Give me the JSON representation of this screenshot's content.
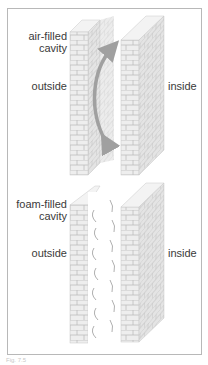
{
  "panels": [
    {
      "id": "air",
      "cavity_label_line1": "air-filled",
      "cavity_label_line2": "cavity",
      "left_label": "outside",
      "right_label": "inside",
      "cavity_type": "air",
      "arrow": "curved double-headed arrow showing air circulation"
    },
    {
      "id": "foam",
      "cavity_label_line1": "foam-filled",
      "cavity_label_line2": "cavity",
      "left_label": "outside",
      "right_label": "inside",
      "cavity_type": "foam"
    }
  ],
  "colors": {
    "brick_face": "#eeeeee",
    "brick_side": "#e2e2e2",
    "brick_top": "#f3f3f3",
    "mortar": "#bdbdbd",
    "arrow": "#a0a0a0",
    "frame": "#b8b8b8",
    "text": "#3a3a3a"
  },
  "caption": "Fig. 7.5"
}
